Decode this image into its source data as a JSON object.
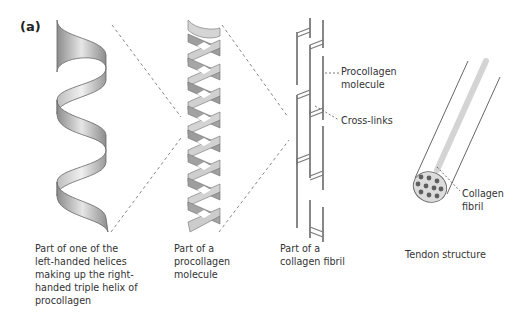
{
  "figure": {
    "panel_label": "(a)",
    "stages": [
      {
        "id": "single-helix",
        "caption": "Part of one of the\nleft-handed helices\nmaking up the right-\nhanded triple helix of\nprocollagen"
      },
      {
        "id": "procollagen-molecule",
        "caption": "Part of a\nprocollagen\nmolecule"
      },
      {
        "id": "collagen-fibril",
        "caption": "Part of a\ncollagen fibril",
        "callouts": [
          {
            "label": "Procollagen\nmolecule"
          },
          {
            "label": "Cross-links"
          }
        ]
      },
      {
        "id": "tendon",
        "caption": "Tendon structure",
        "callouts": [
          {
            "label": "Collagen\nfibril"
          }
        ]
      }
    ],
    "colors": {
      "ribbon_light": "#e2e2e2",
      "ribbon_dark": "#8a8a8a",
      "line_gray": "#777777",
      "fibril_dot": "#666666",
      "tendon_fill": "#dddddd",
      "highlight_fibril": "#d6d6d6"
    }
  }
}
